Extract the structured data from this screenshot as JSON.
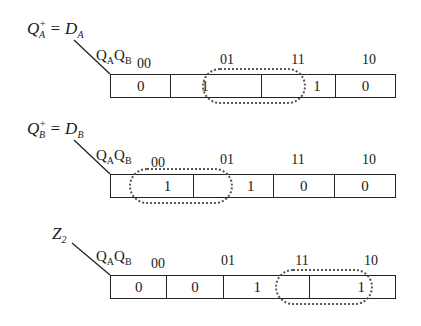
{
  "maps": [
    {
      "function_label": {
        "var": "Q",
        "sup": "+",
        "sub": "A",
        "eq": "= D",
        "rhs_sub": "A"
      },
      "variables": {
        "v1": "Q",
        "v1_sub": "A",
        "v2": "Q",
        "v2_sub": "B"
      },
      "columns": [
        "00",
        "01",
        "11",
        "10"
      ],
      "cells": [
        "0",
        "1",
        "1",
        "0"
      ],
      "grouping": "cells 01 and 11"
    },
    {
      "function_label": {
        "var": "Q",
        "sup": "+",
        "sub": "B",
        "eq": "= D",
        "rhs_sub": "B"
      },
      "variables": {
        "v1": "Q",
        "v1_sub": "A",
        "v2": "Q",
        "v2_sub": "B"
      },
      "columns": [
        "00",
        "01",
        "11",
        "10"
      ],
      "cells": [
        "1",
        "1",
        "0",
        "0"
      ],
      "grouping": "cells 00 and 01"
    },
    {
      "function_label": {
        "var": "Z",
        "sub": "2"
      },
      "variables": {
        "v1": "Q",
        "v1_sub": "A",
        "v2": "Q",
        "v2_sub": "B"
      },
      "columns": [
        "00",
        "01",
        "11",
        "10"
      ],
      "cells": [
        "0",
        "0",
        "1",
        "1"
      ],
      "grouping": "cells 11 and 10"
    }
  ]
}
